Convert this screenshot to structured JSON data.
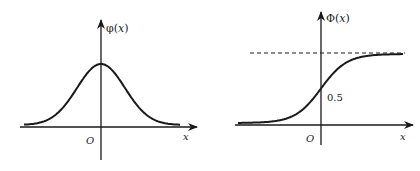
{
  "diagrams": [
    {
      "name": "normal-pdf",
      "y_label_fn": "φ",
      "y_label_arg": "x",
      "x_label": "x",
      "origin_label": "O",
      "curve": "bell-shaped normal density, peak at x=0"
    },
    {
      "name": "normal-cdf",
      "y_label_fn": "Φ",
      "y_label_arg": "x",
      "x_label": "x",
      "origin_label": "O",
      "value_at_origin_label": "0.5",
      "asymptote": "dashed horizontal line at Φ=1",
      "curve": "S-shaped normal cumulative distribution"
    }
  ],
  "colors": {
    "ink": "#1a1a1a",
    "background": "#ffffff"
  }
}
